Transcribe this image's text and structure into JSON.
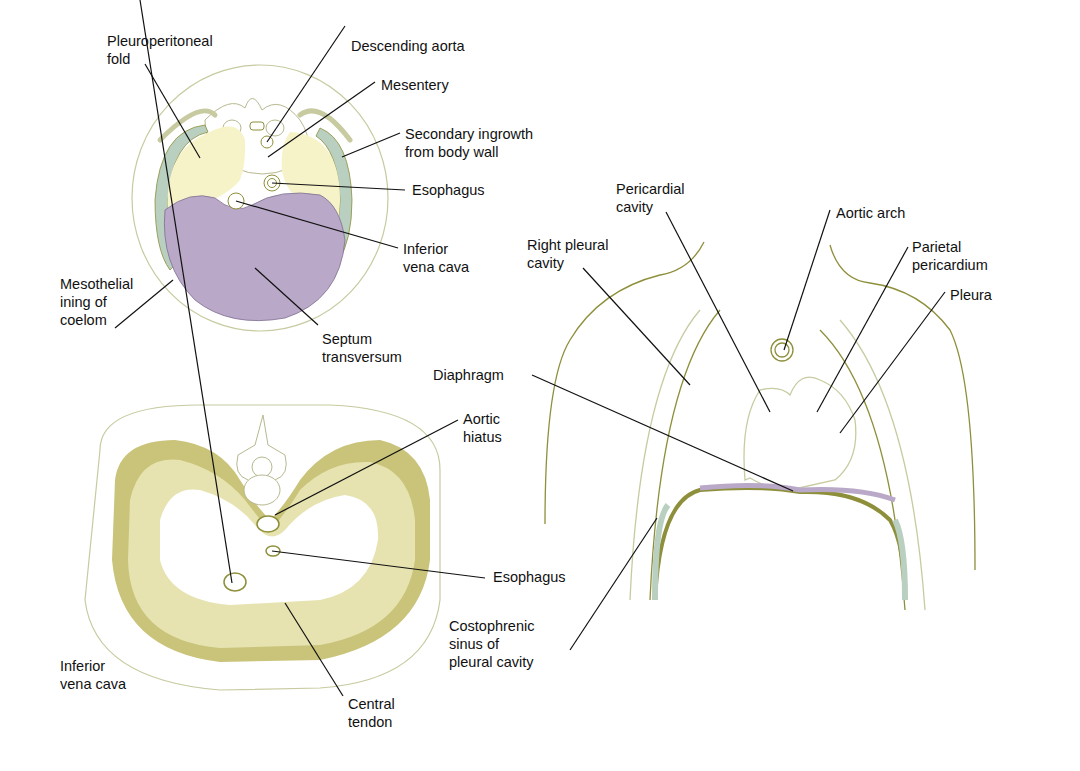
{
  "figure": {
    "panels": [
      {
        "id": "embryo-cross-section",
        "labels": {
          "pleuroperitoneal_fold": "Pleuroperitoneal\nfold",
          "descending_aorta": "Descending aorta",
          "mesentery": "Mesentery",
          "secondary_ingrowth": "Secondary ingrowth\nfrom body wall",
          "esophagus": "Esophagus",
          "inferior_vena_cava": "Inferior\nvena cava",
          "mesothelial_lining": "Mesothelial\nining of\ncoelom",
          "septum_transversum": "Septum\ntransversum"
        }
      },
      {
        "id": "adult-diaphragm-inferior-view",
        "labels": {
          "aortic_hiatus": "Aortic\nhiatus",
          "esophagus": "Esophagus",
          "inferior_vena_cava": "Inferior\nvena cava",
          "central_tendon": "Central\ntendon"
        }
      },
      {
        "id": "coronal-thorax-section",
        "labels": {
          "pericardial_cavity": "Pericardial\ncavity",
          "aortic_arch": "Aortic arch",
          "right_pleural_cavity": "Right pleural\ncavity",
          "parietal_pericardium": "Parietal\npericardium",
          "pleura": "Pleura",
          "diaphragm": "Diaphragm",
          "costophrenic_sinus": "Costophrenic\nsinus of\npleural cavity"
        }
      }
    ],
    "colors": {
      "pleuroperitoneal_fold": "#f7f3c8",
      "septum_transversum": "#b9a8c8",
      "body_wall_ingrowth": "#b9cfc0",
      "diaphragm_muscle": "#e6e3b0",
      "diaphragm_muscle_dark": "#c9c47a",
      "outline": "#8e8f3a",
      "leader_line": "#111111"
    }
  }
}
